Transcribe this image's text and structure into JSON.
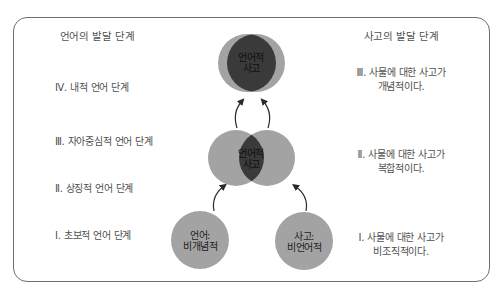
{
  "colors": {
    "circle_light": "#a3a3a3",
    "circle_dark": "#3a3a3a",
    "arrow": "#2a2a2a",
    "frame": "#6e6e6e",
    "text": "#4f4f4f"
  },
  "language": {
    "heading": "언어의 발달 단계",
    "stages": [
      {
        "label": "Ⅳ. 내적 언어 단계"
      },
      {
        "label": "Ⅲ. 자아중심적 언어 단계"
      },
      {
        "label": "Ⅱ. 상징적 언어 단계"
      },
      {
        "label": "Ⅰ. 초보적 언어 단계"
      }
    ]
  },
  "thought": {
    "heading": "사고의 발달 단계",
    "stages": [
      {
        "line1": "Ⅲ. 사물에 대한 사고가",
        "line2": "개념적이다."
      },
      {
        "line1": "Ⅱ. 사물에 대한 사고가",
        "line2": "복합적이다."
      },
      {
        "line1": "Ⅰ. 사물에 대한 사고가",
        "line2": "비조직적이다."
      }
    ]
  },
  "circles": {
    "top": {
      "line1": "언어적",
      "line2": "사고"
    },
    "middle": {
      "line1": "언어적",
      "line2": "사고"
    },
    "bottom_left": {
      "line1": "언어:",
      "line2": "비개념적"
    },
    "bottom_right": {
      "line1": "사고:",
      "line2": "비언어적"
    }
  }
}
